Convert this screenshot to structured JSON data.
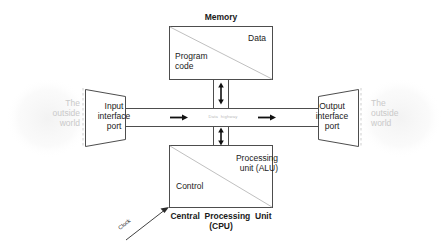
{
  "diagram": {
    "memory": {
      "title": "Memory",
      "data_label": "Data",
      "program_label": "Program\ncode"
    },
    "outside_world": {
      "left_label": "The\noutside\nworld",
      "right_label": "The\noutside\nworld"
    },
    "ports": {
      "input_label": "Input\ninterface\nport",
      "output_label": "Output\ninterface\nport"
    },
    "bus": {
      "label": "Data  highway",
      "left_arrow": "arrow-right-icon",
      "right_arrow": "arrow-right-icon",
      "memory_arrow": "arrow-up-down-icon",
      "cpu_arrow": "arrow-up-down-icon"
    },
    "cpu": {
      "alu_label": "Processing\nunit (ALU)",
      "control_label": "Control",
      "title": "Central  Processing  Unit\n(CPU)",
      "clock_label": "Clock"
    },
    "colors": {
      "stroke": "#4d4d4d",
      "faint_text": "#c9c9c9",
      "bus_text": "#b9b9b9",
      "diagonal": "#c0c0c0",
      "dashed_boundary": "#cfcfcf",
      "background": "#ffffff",
      "text": "#1a1a1a"
    }
  }
}
